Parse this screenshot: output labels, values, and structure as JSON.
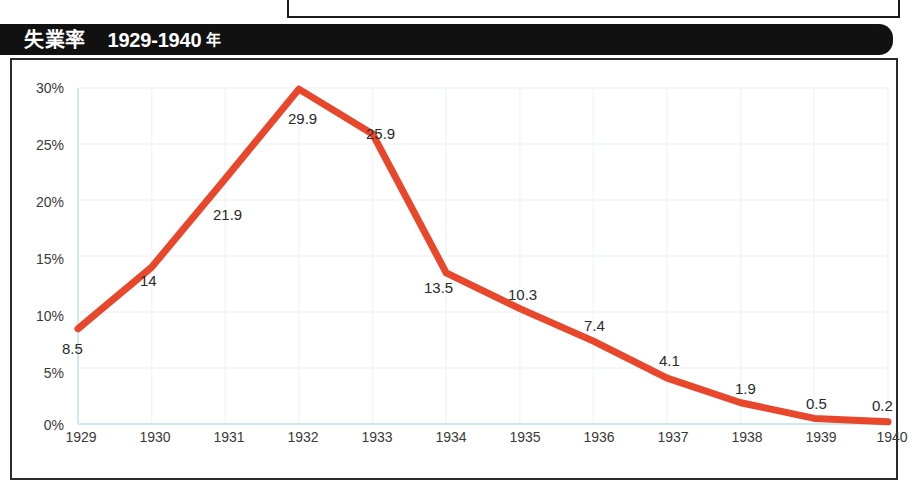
{
  "title": {
    "main": "失業率",
    "range": "1929-1940",
    "suffix": "年"
  },
  "colors": {
    "line": "#e8472b",
    "title_bar_bg": "#111111",
    "title_text": "#ffffff",
    "panel_border": "#2b2b2b",
    "axis": "#cfe9f0",
    "grid": "#f2f4f6",
    "tick_text": "#3a3a3a",
    "data_label_text": "#2a2a2a"
  },
  "chart_data": {
    "type": "line",
    "title": "失業率 1929-1940 年",
    "xlabel": "",
    "ylabel": "",
    "categories": [
      "1929",
      "1930",
      "1931",
      "1932",
      "1933",
      "1934",
      "1935",
      "1936",
      "1937",
      "1938",
      "1939",
      "1940"
    ],
    "values": [
      8.5,
      14,
      21.9,
      29.9,
      25.9,
      13.5,
      10.3,
      7.4,
      4.1,
      1.9,
      0.5,
      0.2
    ],
    "data_labels": [
      "8.5",
      "14",
      "21.9",
      "29.9",
      "25.9",
      "13.5",
      "10.3",
      "7.4",
      "4.1",
      "1.9",
      "0.5",
      "0.2"
    ],
    "ylim": [
      0,
      30
    ],
    "yticks": [
      0,
      5,
      10,
      15,
      20,
      25,
      30
    ],
    "ytick_labels": [
      "0%",
      "5%",
      "10%",
      "15%",
      "20%",
      "25%",
      "30%"
    ],
    "xtick_labels": [
      "1929",
      "1930",
      "1931",
      "1932",
      "1933",
      "1934",
      "1935",
      "1936",
      "1937",
      "1938",
      "1939",
      "1940"
    ],
    "grid": true,
    "legend": false,
    "series": [
      {
        "name": "失業率",
        "values": [
          8.5,
          14,
          21.9,
          29.9,
          25.9,
          13.5,
          10.3,
          7.4,
          4.1,
          1.9,
          0.5,
          0.2
        ]
      }
    ]
  },
  "ytick_positions": [
    {
      "label": "30%",
      "top": 81
    },
    {
      "label": "25%",
      "top": 138
    },
    {
      "label": "20%",
      "top": 195
    },
    {
      "label": "15%",
      "top": 252
    },
    {
      "label": "10%",
      "top": 309
    },
    {
      "label": "5%",
      "top": 366
    },
    {
      "label": "0%",
      "top": 418
    }
  ],
  "xtick_positions": [
    {
      "label": "1929",
      "left": 51
    },
    {
      "label": "1930",
      "left": 125
    },
    {
      "label": "1931",
      "left": 199
    },
    {
      "label": "1932",
      "left": 273
    },
    {
      "label": "1933",
      "left": 347
    },
    {
      "label": "1934",
      "left": 421
    },
    {
      "label": "1935",
      "left": 495
    },
    {
      "label": "1936",
      "left": 569
    },
    {
      "label": "1937",
      "left": 643
    },
    {
      "label": "1938",
      "left": 717
    },
    {
      "label": "1939",
      "left": 791
    },
    {
      "label": "1940",
      "left": 862
    }
  ],
  "data_label_positions": [
    {
      "label": "8.5",
      "left": 62,
      "top": 341
    },
    {
      "label": "14",
      "left": 140,
      "top": 273
    },
    {
      "label": "21.9",
      "left": 213,
      "top": 207
    },
    {
      "label": "29.9",
      "left": 288,
      "top": 111
    },
    {
      "label": "25.9",
      "left": 366,
      "top": 126
    },
    {
      "label": "13.5",
      "left": 424,
      "top": 280
    },
    {
      "label": "10.3",
      "left": 508,
      "top": 287
    },
    {
      "label": "7.4",
      "left": 584,
      "top": 318
    },
    {
      "label": "4.1",
      "left": 659,
      "top": 353
    },
    {
      "label": "1.9",
      "left": 735,
      "top": 381
    },
    {
      "label": "0.5",
      "left": 806,
      "top": 396
    },
    {
      "label": "0.2",
      "left": 872,
      "top": 398
    }
  ]
}
